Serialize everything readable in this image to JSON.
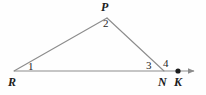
{
  "figure": {
    "kind": "geometry-diagram",
    "canvas": {
      "width": 206,
      "height": 95,
      "background": "#fefefe"
    },
    "stroke": {
      "color": "#8c8c8c",
      "width": 1.1,
      "ray_color": "#8c8c8c"
    },
    "points": [
      {
        "id": "R",
        "label": "R",
        "x": 14,
        "y": 71,
        "label_x": 13,
        "label_y": 84
      },
      {
        "id": "P",
        "label": "P",
        "x": 107,
        "y": 18,
        "label_x": 106,
        "label_y": 9
      },
      {
        "id": "N",
        "label": "N",
        "x": 164,
        "y": 71,
        "label_x": 163,
        "label_y": 84
      },
      {
        "id": "K",
        "label": "K",
        "x": 178,
        "y": 71,
        "label_x": 178,
        "label_y": 84
      }
    ],
    "segments": [
      {
        "id": "RP",
        "from": "R",
        "to": "P"
      },
      {
        "id": "PN",
        "from": "P",
        "to": "N"
      },
      {
        "id": "RK_ray",
        "from": "R",
        "to": "arrow-tip"
      }
    ],
    "ray": {
      "tip_x": 201,
      "tip_y": 71,
      "arrowhead": true
    },
    "dot": {
      "at": "K",
      "x": 178,
      "y": 71,
      "radius": 2.6,
      "color": "#1c1c1c"
    },
    "angles": [
      {
        "id": "angle-1",
        "label": "1",
        "at_vertex": "R",
        "x": 31,
        "y": 68
      },
      {
        "id": "angle-2",
        "label": "2",
        "at_vertex": "P",
        "x": 106,
        "y": 25
      },
      {
        "id": "angle-3",
        "label": "3",
        "at_vertex": "N",
        "x": 149,
        "y": 68
      },
      {
        "id": "angle-4",
        "label": "4",
        "at_vertex": "N",
        "x": 166,
        "y": 66
      }
    ]
  }
}
